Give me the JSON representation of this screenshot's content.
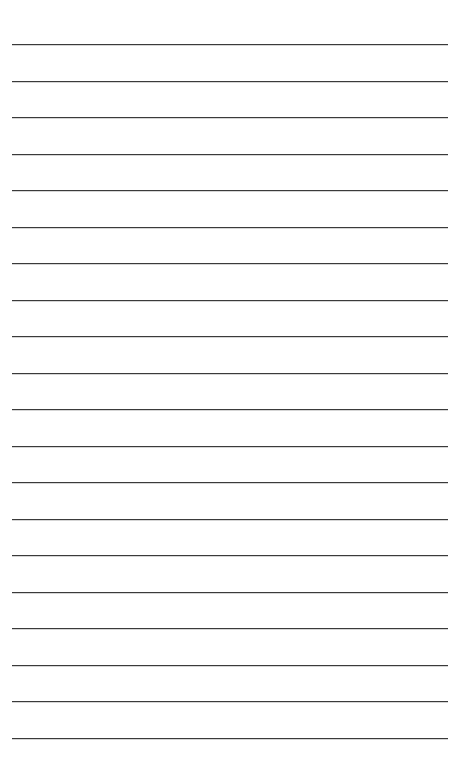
{
  "page": {
    "type": "lined-paper",
    "line_count": 20,
    "line_color": "#3a3a3a",
    "background": "#ffffff",
    "first_line_y": 44,
    "line_spacing": 36.5,
    "line_left": 12,
    "line_width": 436,
    "lines": []
  }
}
